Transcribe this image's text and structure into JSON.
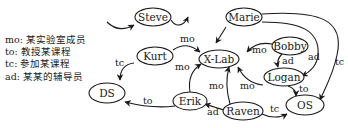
{
  "legend": [
    {
      "key": "mo",
      "text": "mo: 某实验室成员"
    },
    {
      "key": "to",
      "text": "to: 教授某课程"
    },
    {
      "key": "tc",
      "text": "tc: 参加某课程"
    },
    {
      "key": "ad",
      "text": "ad: 某某的辅导员"
    }
  ],
  "nodes": {
    "steve": "Steve",
    "marie": "Marie",
    "kurt": "Kurt",
    "xlab": "X-Lab",
    "bobby": "Bobby",
    "logan": "Logan",
    "ds": "DS",
    "erik": "Erik",
    "raven": "Raven",
    "os": "OS"
  },
  "edges": {
    "kurt_xlab": "mo",
    "erik_xlab_top": "mo",
    "kurt_ds": "tc",
    "bobby_xlab": "mo",
    "bobby_logan": "ad",
    "marie_logan": "ad",
    "marie_os": "tc",
    "erik_ds": "to",
    "raven_xlab": "mo",
    "logan_xlab": "mo",
    "logan_os": "to",
    "raven_erik": "ad",
    "raven_os": "tc"
  }
}
